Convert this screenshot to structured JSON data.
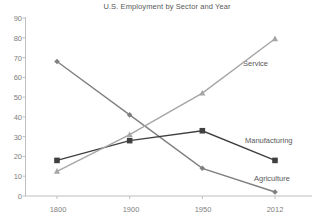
{
  "chart_data": {
    "type": "line",
    "title": "U.S. Employment by Sector and Year",
    "xlabel": "",
    "ylabel": "",
    "categories": [
      "1800",
      "1900",
      "1950",
      "2012"
    ],
    "ylim": [
      0,
      90
    ],
    "yticks": [
      "0",
      "10",
      "20",
      "30",
      "40",
      "50",
      "60",
      "70",
      "80",
      "90"
    ],
    "grid": false,
    "legend": "inline-series-labels",
    "series": [
      {
        "name": "Agriculture",
        "marker": "diamond",
        "color": "#808080",
        "values": [
          68,
          41,
          14,
          2
        ],
        "label_text": "Agriculture"
      },
      {
        "name": "Manufacturing",
        "marker": "square",
        "color": "#404040",
        "values": [
          18,
          28,
          33,
          18
        ],
        "label_text": "Manufacturing"
      },
      {
        "name": "Service",
        "marker": "triangle",
        "color": "#a6a6a6",
        "values": [
          12.5,
          31,
          52,
          79.5
        ],
        "label_text": "Service"
      }
    ]
  },
  "axis": {
    "y_tick_labels": [
      "90",
      "80",
      "70",
      "60",
      "50",
      "40",
      "30",
      "20",
      "10",
      "0"
    ],
    "x_tick_labels": [
      "1800",
      "1900",
      "1950",
      "2012"
    ]
  },
  "colors": {
    "agriculture": "#808080",
    "manufacturing": "#404040",
    "service": "#a6a6a6",
    "axis": "#bfbfbf",
    "text": "#808080",
    "title_text": "#595959"
  }
}
